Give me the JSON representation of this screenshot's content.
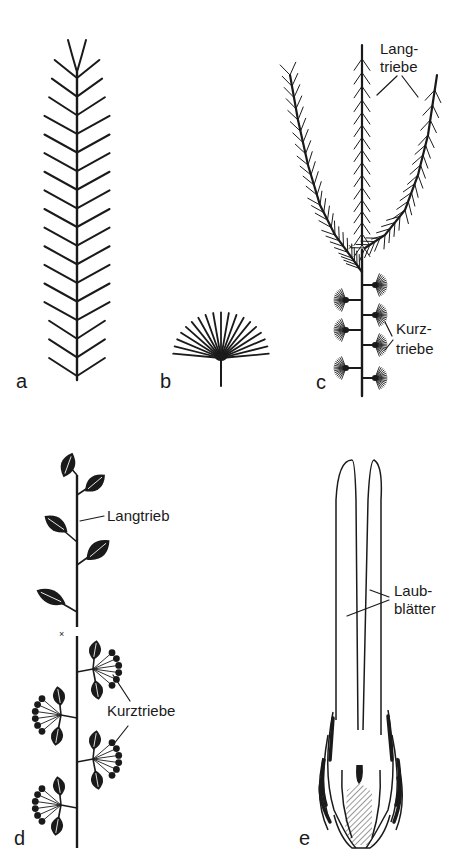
{
  "figure": {
    "panels": [
      {
        "id": "a",
        "letter": "a"
      },
      {
        "id": "b",
        "letter": "b"
      },
      {
        "id": "c",
        "letter": "c",
        "annotations": {
          "long_shoots": [
            "Lang-",
            "triebe"
          ],
          "short_shoots": [
            "Kurz-",
            "triebe"
          ]
        }
      },
      {
        "id": "d",
        "letter": "d",
        "annotations": {
          "long_shoot": "Langtrieb",
          "short_shoots": "Kurztriebe"
        }
      },
      {
        "id": "e",
        "letter": "e",
        "annotations": {
          "foliage_leaves": [
            "Laub-",
            "blätter"
          ]
        }
      }
    ],
    "colors": {
      "ink": "#1a1a1a",
      "background": "#ffffff"
    }
  }
}
